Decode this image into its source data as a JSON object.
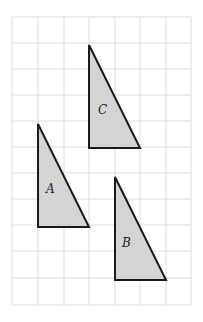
{
  "diagram": {
    "type": "grid-triangles",
    "grid": {
      "columns": 7,
      "rows": 11,
      "color": "#dcdcdc"
    },
    "shapes": [
      {
        "label": "C",
        "fill": "#d4d4d4",
        "stroke": "#1a1a1a"
      },
      {
        "label": "A",
        "fill": "#d4d4d4",
        "stroke": "#1a1a1a"
      },
      {
        "label": "B",
        "fill": "#d4d4d4",
        "stroke": "#1a1a1a"
      }
    ]
  }
}
